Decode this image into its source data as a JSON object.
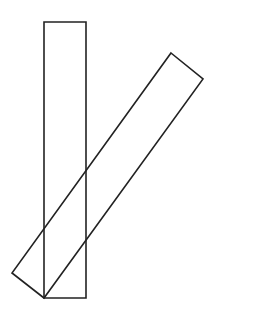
{
  "diagram": {
    "canvas": {
      "width": 276,
      "height": 317,
      "background": "#ffffff"
    },
    "stroke": {
      "color": "#222222",
      "width": 1.6
    },
    "shapes": [
      {
        "name": "vertical-rectangle",
        "type": "rect",
        "points": [
          [
            44,
            22
          ],
          [
            86,
            22
          ],
          [
            86,
            298
          ],
          [
            44,
            298
          ]
        ]
      },
      {
        "name": "tilted-rectangle",
        "type": "polygon",
        "points": [
          [
            171,
            53
          ],
          [
            203,
            79
          ],
          [
            44,
            298
          ],
          [
            12,
            273
          ]
        ]
      }
    ]
  }
}
